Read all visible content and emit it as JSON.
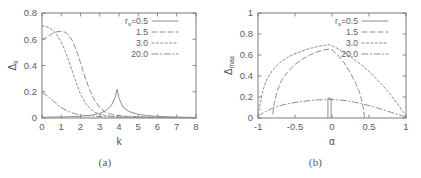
{
  "figure": {
    "panels": [
      {
        "caption": "(a)",
        "ylabel": "Δ",
        "ylabel_sub": "k",
        "xlabel": "k",
        "xticks": [
          "0",
          "1",
          "2",
          "3",
          "4",
          "5",
          "6",
          "7",
          "8"
        ],
        "yticks": [
          "0",
          "0.2",
          "0.4",
          "0.6",
          "0.8"
        ]
      },
      {
        "caption": "(b)",
        "ylabel": "Δ",
        "ylabel_sub": "max",
        "xlabel": "α",
        "xticks": [
          "-1",
          "-0.5",
          "0",
          "0.5",
          "1"
        ],
        "yticks": [
          "0",
          "0.2",
          "0.4",
          "0.6",
          "0.8",
          "1"
        ]
      }
    ],
    "legend": {
      "prefix": "r",
      "prefix_sub": "s",
      "prefix_eq": "=",
      "entries": [
        {
          "label": "0.5",
          "style": "solid"
        },
        {
          "label": "1.5",
          "style": "dashed"
        },
        {
          "label": "3.0",
          "style": "dotted"
        },
        {
          "label": "20.0",
          "style": "dashdot"
        }
      ]
    },
    "colors": {
      "curve": "#8e8e8e",
      "axis": "#6e6e6e",
      "text": "#5d5d5d",
      "background": "#ffffff"
    }
  },
  "chart_data": [
    {
      "type": "line",
      "title": "(a)",
      "xlabel": "k",
      "ylabel": "Δ_k",
      "xlim": [
        0,
        8
      ],
      "ylim": [
        0,
        0.8
      ],
      "grid": false,
      "legend_position": "top-right",
      "series": [
        {
          "name": "r_s=0.5",
          "style": "solid",
          "x": [
            0,
            0.5,
            1.0,
            1.5,
            2.0,
            2.5,
            3.0,
            3.3,
            3.6,
            3.8,
            3.9,
            4.0,
            4.2,
            4.5,
            5.0,
            5.5,
            6.0,
            6.5,
            7.0,
            7.5,
            8.0
          ],
          "y": [
            0.006,
            0.007,
            0.008,
            0.01,
            0.013,
            0.02,
            0.035,
            0.055,
            0.095,
            0.155,
            0.22,
            0.15,
            0.085,
            0.05,
            0.028,
            0.018,
            0.012,
            0.009,
            0.007,
            0.005,
            0.004
          ]
        },
        {
          "name": "r_s=1.5",
          "style": "dashed",
          "x": [
            0,
            0.25,
            0.5,
            0.75,
            1.0,
            1.2,
            1.4,
            1.6,
            1.8,
            2.0,
            2.25,
            2.5,
            2.75,
            3.0,
            3.3,
            3.6,
            4.0,
            4.5,
            5.0,
            6.0,
            7.0,
            8.0
          ],
          "y": [
            0.598,
            0.615,
            0.64,
            0.656,
            0.661,
            0.654,
            0.63,
            0.583,
            0.51,
            0.42,
            0.305,
            0.205,
            0.13,
            0.08,
            0.043,
            0.028,
            0.018,
            0.012,
            0.009,
            0.006,
            0.004,
            0.003
          ]
        },
        {
          "name": "r_s=3.0",
          "style": "dotted",
          "x": [
            0,
            0.2,
            0.4,
            0.6,
            0.8,
            1.0,
            1.2,
            1.4,
            1.6,
            1.8,
            2.0,
            2.25,
            2.5,
            2.75,
            3.0,
            3.5,
            4.0,
            5.0,
            6.0,
            7.0,
            8.0
          ],
          "y": [
            0.703,
            0.698,
            0.686,
            0.663,
            0.628,
            0.578,
            0.512,
            0.432,
            0.345,
            0.258,
            0.182,
            0.115,
            0.07,
            0.044,
            0.029,
            0.015,
            0.009,
            0.005,
            0.003,
            0.002,
            0.002
          ]
        },
        {
          "name": "r_s=20.0",
          "style": "dashdot",
          "x": [
            0,
            0.2,
            0.4,
            0.6,
            0.8,
            1.0,
            1.25,
            1.5,
            1.75,
            2.0,
            2.5,
            3.0,
            3.5,
            4.0,
            5.0,
            6.0,
            7.0,
            8.0
          ],
          "y": [
            0.192,
            0.176,
            0.154,
            0.128,
            0.102,
            0.08,
            0.058,
            0.042,
            0.031,
            0.024,
            0.015,
            0.011,
            0.009,
            0.008,
            0.006,
            0.005,
            0.004,
            0.003
          ]
        }
      ]
    },
    {
      "type": "line",
      "title": "(b)",
      "xlabel": "α",
      "ylabel": "Δ_max",
      "xlim": [
        -1,
        1
      ],
      "ylim": [
        0,
        1
      ],
      "grid": false,
      "legend_position": "top-right",
      "series": [
        {
          "name": "r_s=0.5",
          "style": "solid",
          "note": "narrow spike near alpha = -0.03",
          "x": [
            -0.055,
            -0.055,
            -0.012,
            -0.012
          ],
          "y": [
            0.0,
            0.19,
            0.19,
            0.0
          ]
        },
        {
          "name": "r_s=1.5",
          "style": "dashed",
          "x": [
            -0.8,
            -0.78,
            -0.74,
            -0.68,
            -0.6,
            -0.5,
            -0.4,
            -0.3,
            -0.2,
            -0.1,
            -0.04,
            0.0,
            0.08,
            0.16,
            0.24,
            0.32,
            0.38,
            0.42,
            0.44
          ],
          "y": [
            0.04,
            0.14,
            0.26,
            0.36,
            0.44,
            0.51,
            0.56,
            0.6,
            0.63,
            0.65,
            0.655,
            0.648,
            0.6,
            0.53,
            0.44,
            0.33,
            0.23,
            0.11,
            0.0
          ]
        },
        {
          "name": "r_s=3.0",
          "style": "dotted",
          "x": [
            -1.0,
            -0.97,
            -0.93,
            -0.88,
            -0.8,
            -0.7,
            -0.6,
            -0.5,
            -0.4,
            -0.3,
            -0.2,
            -0.1,
            -0.03,
            0.05,
            0.15,
            0.28,
            0.4,
            0.52,
            0.64,
            0.76,
            0.88,
            0.96,
            1.0
          ],
          "y": [
            0.03,
            0.14,
            0.27,
            0.37,
            0.46,
            0.53,
            0.578,
            0.612,
            0.64,
            0.662,
            0.68,
            0.693,
            0.697,
            0.672,
            0.63,
            0.57,
            0.505,
            0.43,
            0.345,
            0.25,
            0.14,
            0.06,
            0.02
          ]
        },
        {
          "name": "r_s=20.0",
          "style": "dashdot",
          "x": [
            -1.0,
            -0.9,
            -0.8,
            -0.7,
            -0.6,
            -0.5,
            -0.4,
            -0.3,
            -0.2,
            -0.1,
            0.0,
            0.1,
            0.2,
            0.3,
            0.4,
            0.5,
            0.6,
            0.7,
            0.8,
            0.9,
            1.0
          ],
          "y": [
            0.018,
            0.06,
            0.095,
            0.118,
            0.135,
            0.148,
            0.158,
            0.166,
            0.172,
            0.175,
            0.176,
            0.172,
            0.164,
            0.152,
            0.136,
            0.118,
            0.098,
            0.076,
            0.054,
            0.032,
            0.01
          ]
        }
      ]
    }
  ]
}
